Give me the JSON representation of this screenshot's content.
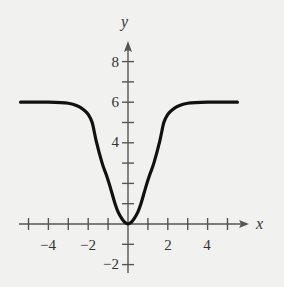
{
  "chart_data": {
    "type": "line",
    "title": "",
    "xlabel": "x",
    "ylabel": "y",
    "xlim": [
      -5.4,
      6
    ],
    "ylim": [
      -2.5,
      9
    ],
    "grid": false,
    "legend": null,
    "x_ticks": [
      -5,
      -4,
      -3,
      -2,
      -1,
      1,
      2,
      3,
      4,
      5
    ],
    "x_tick_labels": [
      "-4",
      "-2",
      "2",
      "4"
    ],
    "x_tick_label_values": [
      -4,
      -2,
      2,
      4
    ],
    "y_ticks": [
      -2,
      -1,
      1,
      2,
      3,
      4,
      5,
      6,
      7,
      8
    ],
    "y_tick_labels": [
      "-2",
      "4",
      "6",
      "8"
    ],
    "y_tick_label_values": [
      -2,
      4,
      6,
      8
    ],
    "series": [
      {
        "name": "curve",
        "x": [
          -5.4,
          -4,
          -3,
          -2.5,
          -2.2,
          -2,
          -1.8,
          -1.6,
          -1.3,
          -1.1,
          -0.95,
          -0.8,
          -0.65,
          -0.5,
          -0.3,
          -0.15,
          0,
          0.15,
          0.3,
          0.5,
          0.65,
          0.8,
          0.95,
          1.1,
          1.3,
          1.6,
          1.8,
          2,
          2.2,
          2.5,
          3,
          4,
          5.5
        ],
        "y": [
          6,
          6,
          5.95,
          5.8,
          5.6,
          5.4,
          5.0,
          4.1,
          3.0,
          2.45,
          2.0,
          1.5,
          1.0,
          0.6,
          0.25,
          0.07,
          0,
          0.07,
          0.25,
          0.6,
          1.0,
          1.5,
          2.0,
          2.45,
          3.0,
          4.1,
          5.0,
          5.4,
          5.6,
          5.8,
          5.95,
          6,
          6
        ]
      }
    ]
  },
  "labels": {
    "x_axis": "x",
    "y_axis": "y",
    "xt_m4": "−4",
    "xt_m2": "−2",
    "xt_2": "2",
    "xt_4": "4",
    "yt_8": "8",
    "yt_6": "6",
    "yt_4": "4",
    "yt_m2": "−2"
  },
  "colors": {
    "curve": "#111111",
    "axes": "#555555",
    "background": "#f1f1f0"
  }
}
